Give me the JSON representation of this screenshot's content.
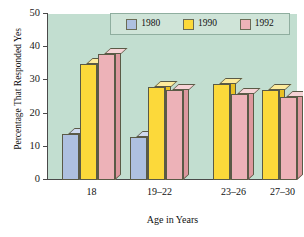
{
  "chart_data": {
    "type": "bar",
    "title": "",
    "xlabel": "Age in Years",
    "ylabel": "Percentage That Responded Yes",
    "categories": [
      "18",
      "19–22",
      "23–26",
      "27–30"
    ],
    "series": [
      {
        "name": "1980",
        "color": "#aec0e0",
        "values": [
          14,
          13,
          null,
          null
        ]
      },
      {
        "name": "1990",
        "color": "#fcd93a",
        "values": [
          35,
          28,
          29,
          27
        ]
      },
      {
        "name": "1992",
        "color": "#edb2b8",
        "values": [
          38,
          27,
          26,
          25
        ]
      }
    ],
    "ylim": [
      0,
      50
    ],
    "yticks": [
      0,
      10,
      20,
      30,
      40,
      50
    ],
    "grid": false,
    "legend_position": "top-center",
    "plot_background": "#c2ded0",
    "three_d": true
  },
  "legend": {
    "items": [
      {
        "label": "1980",
        "color": "#aec0e0"
      },
      {
        "label": "1990",
        "color": "#fcd93a"
      },
      {
        "label": "1992",
        "color": "#edb2b8"
      }
    ]
  },
  "axes": {
    "y_title": "Percentage That Responded Yes",
    "x_title": "Age in Years",
    "y_ticks": [
      "0",
      "10",
      "20",
      "30",
      "40",
      "50"
    ]
  }
}
